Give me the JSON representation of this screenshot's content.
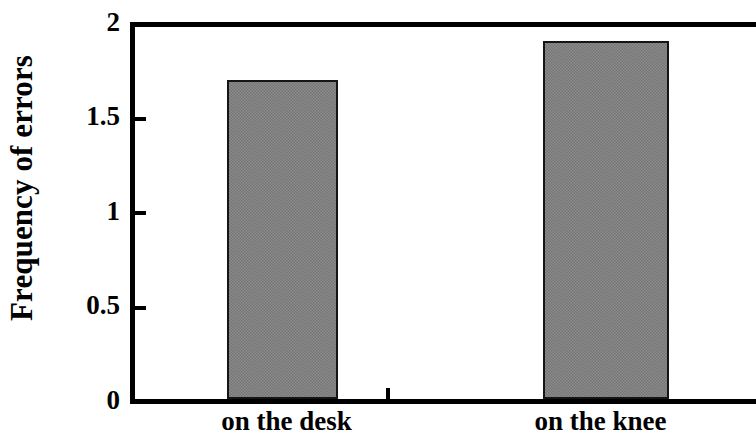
{
  "chart_data": {
    "type": "bar",
    "title": "",
    "xlabel": "",
    "ylabel": "Frequency of errors",
    "categories": [
      "on the desk",
      "on the knee"
    ],
    "values": [
      1.69,
      1.9
    ],
    "ylim": [
      0,
      2
    ],
    "yticks": [
      0,
      0.5,
      1,
      1.5,
      2
    ],
    "ytick_labels": [
      "0",
      "0.5",
      "1",
      "1.5",
      "2"
    ],
    "grid": false,
    "legend": null,
    "series": [
      {
        "name": "Frequency of errors",
        "values": [
          1.69,
          1.9
        ],
        "color": "#808080"
      }
    ],
    "colors": {
      "bar_fill": "#808080",
      "bar_border": "#151515",
      "axis": "#000000",
      "background": "#ffffff",
      "text": "#000000"
    }
  },
  "axes": {
    "y_title": "Frequency of errors",
    "y_tick_labels": [
      {
        "value": 2,
        "label": "2"
      },
      {
        "value": 1.5,
        "label": "1.5"
      },
      {
        "value": 1,
        "label": "1"
      },
      {
        "value": 0.5,
        "label": "0.5"
      },
      {
        "value": 0,
        "label": "0"
      }
    ],
    "x_tick_labels": [
      {
        "label": "on the desk"
      },
      {
        "label": "on the knee"
      }
    ]
  }
}
